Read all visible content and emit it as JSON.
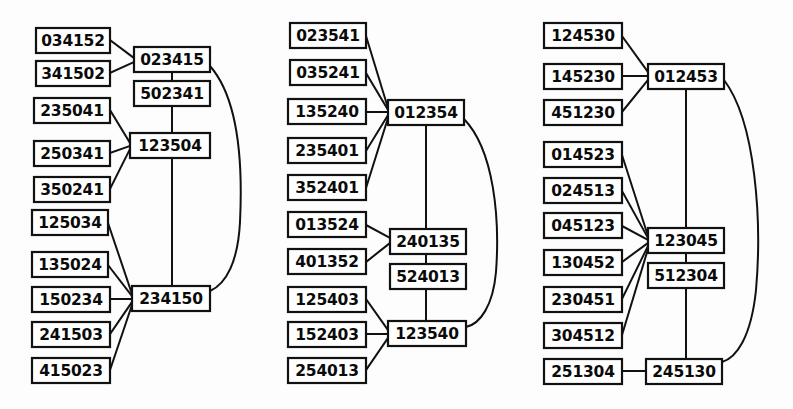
{
  "figure": {
    "kind": "permutation-lattice-diagram",
    "panel_count": 3,
    "stroke_color": "#111111",
    "box_fill": "#ffffff",
    "background": "#fdfdfd"
  },
  "panels": [
    {
      "name": "panel-left",
      "leaves": [
        {
          "label": "034152",
          "x": 36,
          "y": 28
        },
        {
          "label": "341502",
          "x": 36,
          "y": 62
        },
        {
          "label": "235041",
          "x": 33,
          "y": 98
        },
        {
          "label": "250341",
          "x": 33,
          "y": 142
        },
        {
          "label": "350241",
          "x": 33,
          "y": 178
        },
        {
          "label": "125034",
          "x": 30,
          "y": 211
        },
        {
          "label": "135024",
          "x": 30,
          "y": 253
        },
        {
          "label": "150234",
          "x": 30,
          "y": 288
        },
        {
          "label": "135024b",
          "x": 0,
          "y": 0
        }
      ],
      "left_column": [
        "034152",
        "341502",
        "235041",
        "250341",
        "350241",
        "125034",
        "135024",
        "150234",
        "241503",
        "415023"
      ],
      "hubs": [
        "023415",
        "502341",
        "123504",
        "234150"
      ]
    },
    {
      "name": "panel-middle",
      "left_column": [
        "023541",
        "035241",
        "135240",
        "235401",
        "352401",
        "013524",
        "401352",
        "125403",
        "152403",
        "254013"
      ],
      "hubs": [
        "012354",
        "240135",
        "524013",
        "123540"
      ]
    },
    {
      "name": "panel-right",
      "left_column": [
        "124530",
        "145230",
        "451230",
        "014523",
        "024513",
        "045123",
        "130452",
        "230451",
        "304512",
        "251304"
      ],
      "hubs": [
        "012453",
        "123045",
        "512304",
        "245130"
      ]
    }
  ],
  "nodes": {
    "panel-left": {
      "leaves": [
        {
          "id": "L1",
          "label": "034152",
          "x": 36,
          "y": 28,
          "w": 74,
          "h": 25
        },
        {
          "id": "L2",
          "label": "341502",
          "x": 36,
          "y": 61,
          "w": 74,
          "h": 25
        },
        {
          "id": "L3",
          "label": "235041",
          "x": 34,
          "y": 98,
          "w": 76,
          "h": 25
        },
        {
          "id": "L4",
          "label": "250341",
          "x": 34,
          "y": 141,
          "w": 76,
          "h": 25
        },
        {
          "id": "L5",
          "label": "350241",
          "x": 34,
          "y": 177,
          "w": 76,
          "h": 25
        },
        {
          "id": "L6",
          "label": "125034",
          "x": 32,
          "y": 210,
          "w": 76,
          "h": 25
        },
        {
          "id": "L7",
          "label": "135024",
          "x": 32,
          "y": 252,
          "w": 76,
          "h": 25
        },
        {
          "id": "L8",
          "label": "150234",
          "x": 32,
          "y": 287,
          "w": 78,
          "h": 25
        },
        {
          "id": "L9",
          "label": "241503",
          "x": 32,
          "y": 322,
          "w": 78,
          "h": 25
        },
        {
          "id": "L10",
          "label": "415023",
          "x": 32,
          "y": 358,
          "w": 78,
          "h": 25
        }
      ],
      "hubs": [
        {
          "id": "H1",
          "label": "023415",
          "x": 134,
          "y": 47,
          "w": 76,
          "h": 25
        },
        {
          "id": "H2",
          "label": "502341",
          "x": 134,
          "y": 81,
          "w": 76,
          "h": 25
        },
        {
          "id": "H3",
          "label": "123504",
          "x": 130,
          "y": 133,
          "w": 80,
          "h": 25
        },
        {
          "id": "H4",
          "label": "234150",
          "x": 132,
          "y": 286,
          "w": 78,
          "h": 25
        }
      ]
    },
    "panel-middle": {
      "leaves": [
        {
          "id": "M1",
          "label": "023541",
          "x": 290,
          "y": 23,
          "w": 76,
          "h": 25
        },
        {
          "id": "M2",
          "label": "035241",
          "x": 290,
          "y": 60,
          "w": 76,
          "h": 25
        },
        {
          "id": "M3",
          "label": "135240",
          "x": 288,
          "y": 99,
          "w": 78,
          "h": 25
        },
        {
          "id": "M4",
          "label": "235401",
          "x": 288,
          "y": 138,
          "w": 78,
          "h": 25
        },
        {
          "id": "M5",
          "label": "352401",
          "x": 288,
          "y": 175,
          "w": 78,
          "h": 25
        },
        {
          "id": "M6",
          "label": "013524",
          "x": 288,
          "y": 212,
          "w": 78,
          "h": 25
        },
        {
          "id": "M7",
          "label": "401352",
          "x": 288,
          "y": 249,
          "w": 78,
          "h": 25
        },
        {
          "id": "M8",
          "label": "125403",
          "x": 288,
          "y": 287,
          "w": 78,
          "h": 25
        },
        {
          "id": "M9",
          "label": "152403",
          "x": 288,
          "y": 322,
          "w": 78,
          "h": 25
        },
        {
          "id": "M10",
          "label": "254013",
          "x": 288,
          "y": 358,
          "w": 78,
          "h": 25
        }
      ],
      "hubs": [
        {
          "id": "N1",
          "label": "012354",
          "x": 388,
          "y": 100,
          "w": 76,
          "h": 25
        },
        {
          "id": "N2",
          "label": "240135",
          "x": 390,
          "y": 229,
          "w": 76,
          "h": 25
        },
        {
          "id": "N3",
          "label": "524013",
          "x": 390,
          "y": 264,
          "w": 76,
          "h": 25
        },
        {
          "id": "N4",
          "label": "123540",
          "x": 388,
          "y": 321,
          "w": 78,
          "h": 25
        }
      ]
    },
    "panel-right": {
      "leaves": [
        {
          "id": "R1",
          "label": "124530",
          "x": 544,
          "y": 23,
          "w": 78,
          "h": 25
        },
        {
          "id": "R2",
          "label": "145230",
          "x": 544,
          "y": 64,
          "w": 78,
          "h": 25
        },
        {
          "id": "R3",
          "label": "451230",
          "x": 544,
          "y": 100,
          "w": 78,
          "h": 25
        },
        {
          "id": "R4",
          "label": "014523",
          "x": 544,
          "y": 142,
          "w": 78,
          "h": 25
        },
        {
          "id": "R5",
          "label": "024513",
          "x": 544,
          "y": 178,
          "w": 78,
          "h": 25
        },
        {
          "id": "R6",
          "label": "045123",
          "x": 544,
          "y": 213,
          "w": 78,
          "h": 25
        },
        {
          "id": "R7",
          "label": "130452",
          "x": 544,
          "y": 250,
          "w": 78,
          "h": 25
        },
        {
          "id": "R8",
          "label": "230451",
          "x": 544,
          "y": 287,
          "w": 78,
          "h": 25
        },
        {
          "id": "R9",
          "label": "304512",
          "x": 544,
          "y": 323,
          "w": 78,
          "h": 25
        },
        {
          "id": "R10",
          "label": "251304",
          "x": 544,
          "y": 359,
          "w": 78,
          "h": 25
        }
      ],
      "hubs": [
        {
          "id": "S1",
          "label": "012453",
          "x": 648,
          "y": 64,
          "w": 76,
          "h": 25
        },
        {
          "id": "S2",
          "label": "123045",
          "x": 648,
          "y": 228,
          "w": 76,
          "h": 25
        },
        {
          "id": "S3",
          "label": "512304",
          "x": 648,
          "y": 263,
          "w": 76,
          "h": 25
        },
        {
          "id": "S4",
          "label": "245130",
          "x": 646,
          "y": 359,
          "w": 76,
          "h": 25
        }
      ]
    }
  }
}
